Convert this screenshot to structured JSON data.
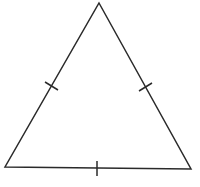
{
  "figure": {
    "description": "Equilateral triangle with congruence tick marks on all three sides",
    "stroke_color": "#2a2a2a",
    "background_color": "#ffffff",
    "stroke_width": 1.5
  },
  "triangle": {
    "vertices": {
      "apex": {
        "x": 99,
        "y": 3
      },
      "bottom_left": {
        "x": 5,
        "y": 167
      },
      "bottom_right": {
        "x": 191,
        "y": 169
      }
    }
  },
  "tick_marks": [
    {
      "side": "left",
      "x1": 45,
      "y1": 82,
      "x2": 58,
      "y2": 90
    },
    {
      "side": "right",
      "x1": 139,
      "y1": 91,
      "x2": 152,
      "y2": 83
    },
    {
      "side": "bottom",
      "x1": 97,
      "y1": 161,
      "x2": 97,
      "y2": 176
    }
  ]
}
